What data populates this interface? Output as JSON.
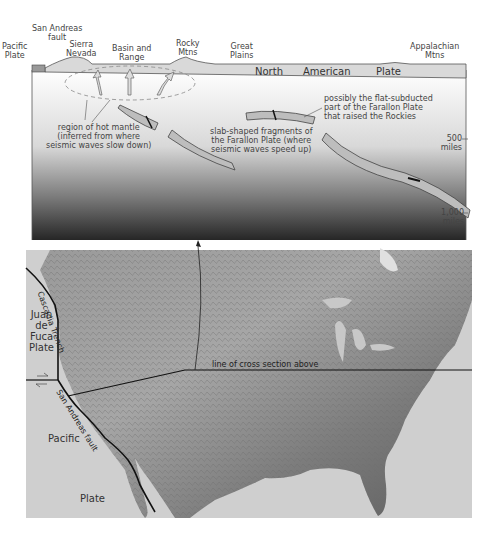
{
  "cross_section": {
    "surface_labels": [
      {
        "id": "pacific-plate",
        "text": "Pacific\nPlate"
      },
      {
        "id": "san-andreas-fault",
        "text": "San Andreas\nfault"
      },
      {
        "id": "sierra-nevada",
        "text": "Sierra\nNevada"
      },
      {
        "id": "basin-and-range",
        "text": "Basin and\nRange"
      },
      {
        "id": "rocky-mtns",
        "text": "Rocky\nMtns"
      },
      {
        "id": "great-plains",
        "text": "Great\nPlains"
      },
      {
        "id": "appalachian-mtns",
        "text": "Appalachian\nMtns"
      }
    ],
    "plate_words": [
      "North",
      "American",
      "Plate"
    ],
    "annotations": {
      "hot_mantle": "region of hot mantle\n(inferred from where\nseismic waves slow down)",
      "slab_fragments": "slab-shaped fragments of\nthe Farallon Plate (where\nseismic waves speed up)",
      "flat_subducted": "possibly the flat-subducted\npart of the Farallon Plate\nthat raised the Rockies"
    },
    "depth_scale": [
      {
        "value": "500",
        "unit": "miles"
      },
      {
        "value": "1,000",
        "unit": "miles"
      }
    ]
  },
  "map": {
    "labels": {
      "juan_de_fuca": "Juan\nde\nFuca\nPlate",
      "cascadia_trench": "Cascadia Trench",
      "san_andreas": "San Andreas fault",
      "pacific": "Pacific",
      "plate": "Plate",
      "section_line": "line of cross section above"
    }
  },
  "colors": {
    "mantle_top": "#ffffff",
    "mantle_bottom": "#2a2a2a",
    "slab": "#bdbdbd",
    "crust": "#d9d9d9",
    "ocean": "#cfcfcf",
    "land": "#8a8a8a"
  }
}
